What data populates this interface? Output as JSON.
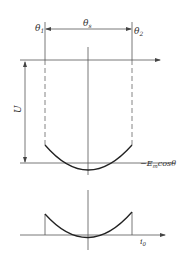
{
  "diagram": {
    "top_plot": {
      "labels": {
        "theta1": "θ",
        "theta1_sub": "1",
        "theta_s": "θ",
        "theta_s_sub": "s",
        "theta2": "θ",
        "theta2_sub": "2",
        "voltage": "U",
        "curve_label_prefix": "−E",
        "curve_label_sub": "m",
        "curve_label_suffix": "cosθ"
      }
    },
    "bottom_plot": {
      "labels": {
        "current": "i",
        "current_sub": "0"
      }
    },
    "colors": {
      "line": "#555555",
      "curve": "#222222",
      "text": "#333333"
    }
  }
}
